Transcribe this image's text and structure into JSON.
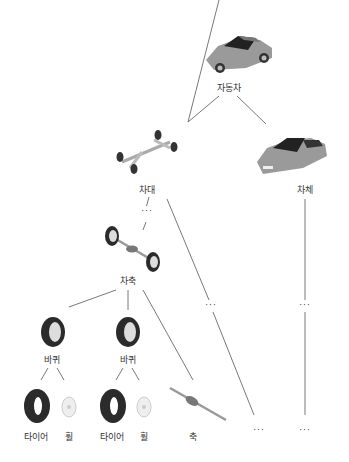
{
  "diagram": {
    "nodes": {
      "car": {
        "label": "자동차",
        "icon": "car-icon"
      },
      "chassis": {
        "label": "차대",
        "icon": "chassis-icon"
      },
      "body": {
        "label": "차체",
        "icon": "car-body-icon"
      },
      "axle": {
        "label": "차축",
        "icon": "axle-icon"
      },
      "wheel1": {
        "label": "바퀴",
        "icon": "wheel-icon"
      },
      "wheel2": {
        "label": "바퀴",
        "icon": "wheel-icon"
      },
      "tire1": {
        "label": "타이어",
        "icon": "tire-icon"
      },
      "rim1": {
        "label": "휠",
        "icon": "rim-icon"
      },
      "tire2": {
        "label": "타이어",
        "icon": "tire-icon"
      },
      "rim2": {
        "label": "휠",
        "icon": "rim-icon"
      },
      "shaft": {
        "label": "축",
        "icon": "shaft-icon"
      }
    },
    "ellipsis": "···",
    "colors": {
      "line": "#555555",
      "car": "#9a9a9a",
      "tire": "#2b2b2b"
    }
  }
}
